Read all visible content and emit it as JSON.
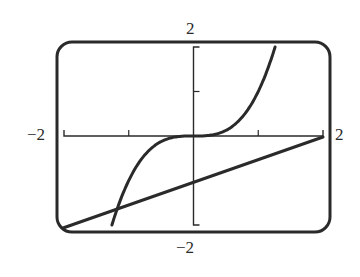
{
  "chart_data": {
    "type": "line",
    "title": "",
    "xlabel": "",
    "ylabel": "",
    "xlim": [
      -2,
      2
    ],
    "ylim": [
      -2,
      2
    ],
    "grid": false,
    "legend": null,
    "window_labels": {
      "x_min": "−2",
      "x_max": "2",
      "y_min": "−2",
      "y_max": "2"
    },
    "x_ticks": [
      -1,
      0,
      1
    ],
    "y_ticks": [
      1
    ],
    "series": [
      {
        "name": "cubic curve",
        "description": "y = x^3",
        "x": [
          -1.26,
          -1.0,
          -0.75,
          -0.5,
          -0.25,
          0,
          0.25,
          0.5,
          0.75,
          1.0,
          1.26
        ],
        "y": [
          -2.0,
          -1.0,
          -0.42,
          -0.125,
          -0.016,
          0,
          0.016,
          0.125,
          0.42,
          1.0,
          2.0
        ]
      },
      {
        "name": "line",
        "description": "y = x/2 - 1",
        "x": [
          -2,
          2
        ],
        "y": [
          -2,
          0
        ]
      }
    ],
    "frame": "rounded calculator screen"
  },
  "colors": {
    "ink": "#2a2a2a",
    "background": "#ffffff"
  }
}
